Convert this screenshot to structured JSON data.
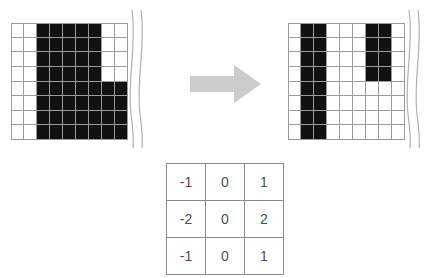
{
  "figure": {
    "arrow_label": "transforms-to"
  },
  "colors": {
    "pixel_on": "#111111",
    "pixel_off": "#ffffff",
    "grid_line": "#9a9a9a",
    "arrow_fill": "#cccccc",
    "table_border": "#8c8c8c",
    "table_text": "#4d4d4d",
    "squiggle": "#b0b0b0"
  },
  "input_image": {
    "label": "input-binary-image",
    "columns": 9,
    "rows": 8,
    "legend": {
      "on": "black pixel",
      "off": "white pixel"
    },
    "pixels": [
      [
        0,
        0,
        1,
        1,
        1,
        1,
        1,
        0,
        0
      ],
      [
        0,
        0,
        1,
        1,
        1,
        1,
        1,
        0,
        0
      ],
      [
        0,
        0,
        1,
        1,
        1,
        1,
        1,
        0,
        0
      ],
      [
        0,
        0,
        1,
        1,
        1,
        1,
        1,
        0,
        0
      ],
      [
        0,
        0,
        1,
        1,
        1,
        1,
        1,
        1,
        1
      ],
      [
        0,
        0,
        1,
        1,
        1,
        1,
        1,
        1,
        1
      ],
      [
        0,
        0,
        1,
        1,
        1,
        1,
        1,
        1,
        1
      ],
      [
        0,
        0,
        1,
        1,
        1,
        1,
        1,
        1,
        1
      ]
    ]
  },
  "output_image": {
    "label": "output-edge-image",
    "columns": 9,
    "rows": 8,
    "legend": {
      "on": "edge response",
      "off": "no response"
    },
    "pixels": [
      [
        0,
        1,
        1,
        0,
        0,
        0,
        1,
        1,
        0
      ],
      [
        0,
        1,
        1,
        0,
        0,
        0,
        1,
        1,
        0
      ],
      [
        0,
        1,
        1,
        0,
        0,
        0,
        1,
        1,
        0
      ],
      [
        0,
        1,
        1,
        0,
        0,
        0,
        1,
        1,
        0
      ],
      [
        0,
        1,
        1,
        0,
        0,
        0,
        0,
        0,
        0
      ],
      [
        0,
        1,
        1,
        0,
        0,
        0,
        0,
        0,
        0
      ],
      [
        0,
        1,
        1,
        0,
        0,
        0,
        0,
        0,
        0
      ],
      [
        0,
        1,
        1,
        0,
        0,
        0,
        0,
        0,
        0
      ]
    ]
  },
  "kernel": {
    "label": "sobel-x-kernel",
    "rows": 3,
    "columns": 3,
    "values": [
      [
        "-1",
        "0",
        "1"
      ],
      [
        "-2",
        "0",
        "2"
      ],
      [
        "-1",
        "0",
        "1"
      ]
    ]
  }
}
